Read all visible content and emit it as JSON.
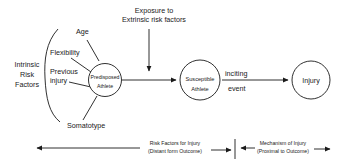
{
  "diagram": {
    "intrinsic": {
      "group_label": [
        "Intrinsic",
        "Risk",
        "Factors"
      ],
      "factors": {
        "age": "Age",
        "flexibility": "Flexibility",
        "previous_injury": [
          "Previous",
          "injury"
        ],
        "somatotype": "Somatotype"
      }
    },
    "nodes": {
      "predisposed": [
        "Predisposed",
        "Athlete"
      ],
      "susceptible": [
        "Susceptible",
        "Athlete"
      ],
      "injury": "Injury"
    },
    "exposure": [
      "Exposure to",
      "Extrinsic risk factors"
    ],
    "inciting_event": [
      "inciting",
      "event"
    ],
    "timeline": {
      "risk_factors": [
        "Risk Factors for Injury",
        "(Distant form Outcome)"
      ],
      "mechanism": [
        "Mechanism of Injury",
        "(Proximal to Outcome)"
      ]
    },
    "colors": {
      "stroke": "#1a1a1a",
      "background": "#ffffff"
    }
  }
}
